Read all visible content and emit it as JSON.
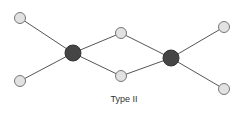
{
  "diagram": {
    "label": "Type II",
    "colors": {
      "hub": "#454545",
      "leaf": "#e2e2e2",
      "edge": "#555555"
    },
    "nodes": [
      {
        "id": "l1",
        "type": "leaf",
        "x": 20,
        "y": 18
      },
      {
        "id": "l2",
        "type": "leaf",
        "x": 20,
        "y": 81
      },
      {
        "id": "h1",
        "type": "hub",
        "x": 73,
        "y": 53
      },
      {
        "id": "m1",
        "type": "leaf",
        "x": 121,
        "y": 33
      },
      {
        "id": "m2",
        "type": "leaf",
        "x": 121,
        "y": 76
      },
      {
        "id": "h2",
        "type": "hub",
        "x": 171,
        "y": 58
      },
      {
        "id": "r1",
        "type": "leaf",
        "x": 224,
        "y": 27
      },
      {
        "id": "r2",
        "type": "leaf",
        "x": 224,
        "y": 89
      }
    ],
    "edges": [
      [
        "l1",
        "h1"
      ],
      [
        "l2",
        "h1"
      ],
      [
        "h1",
        "m1"
      ],
      [
        "h1",
        "m2"
      ],
      [
        "m1",
        "h2"
      ],
      [
        "m2",
        "h2"
      ],
      [
        "h2",
        "r1"
      ],
      [
        "h2",
        "r2"
      ]
    ]
  }
}
